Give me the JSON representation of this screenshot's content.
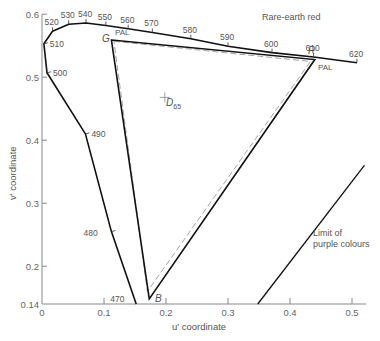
{
  "chart_data": {
    "type": "diagram",
    "xlabel": "u' coordinate",
    "ylabel": "v' coordinate",
    "xlim": [
      0,
      0.52
    ],
    "ylim": [
      0.14,
      0.6
    ],
    "x_ticks": [
      "0",
      "0.1",
      "0.2",
      "0.3",
      "0.4",
      "0.5"
    ],
    "x_tick_values": [
      0,
      0.1,
      0.2,
      0.3,
      0.4,
      0.5
    ],
    "y_ticks": [
      "0.14",
      "0.2",
      "0.3",
      "0.4",
      "0.5",
      "0.6"
    ],
    "y_tick_values": [
      0.14,
      0.2,
      0.3,
      0.4,
      0.5,
      0.6
    ],
    "spectrum_locus": [
      {
        "nm": 470,
        "u": 0.152,
        "v": 0.14
      },
      {
        "nm": 480,
        "u": 0.112,
        "v": 0.255
      },
      {
        "nm": 490,
        "u": 0.07,
        "v": 0.41
      },
      {
        "nm": 500,
        "u": 0.008,
        "v": 0.507
      },
      {
        "nm": 510,
        "u": 0.003,
        "v": 0.553
      },
      {
        "nm": 520,
        "u": 0.017,
        "v": 0.573
      },
      {
        "nm": 530,
        "u": 0.043,
        "v": 0.584
      },
      {
        "nm": 540,
        "u": 0.071,
        "v": 0.586
      },
      {
        "nm": 550,
        "u": 0.103,
        "v": 0.582
      },
      {
        "nm": 560,
        "u": 0.139,
        "v": 0.577
      },
      {
        "nm": 570,
        "u": 0.178,
        "v": 0.571
      },
      {
        "nm": 580,
        "u": 0.24,
        "v": 0.561
      },
      {
        "nm": 590,
        "u": 0.3,
        "v": 0.549
      },
      {
        "nm": 600,
        "u": 0.371,
        "v": 0.539
      },
      {
        "nm": 610,
        "u": 0.438,
        "v": 0.532
      },
      {
        "nm": 620,
        "u": 0.508,
        "v": 0.523
      }
    ],
    "rare_earth_gamut": {
      "G": [
        0.112,
        0.559
      ],
      "R": [
        0.44,
        0.528
      ],
      "B": [
        0.173,
        0.148
      ]
    },
    "pal_gamut": {
      "G": [
        0.116,
        0.557
      ],
      "R": [
        0.433,
        0.525
      ],
      "B": [
        0.17,
        0.16
      ]
    },
    "white_point": {
      "label": "D65",
      "u": 0.198,
      "v": 0.468
    },
    "purple_limit": {
      "from": [
        0.348,
        0.14
      ],
      "to": [
        0.52,
        0.36
      ]
    },
    "annotations": {
      "rare_earth_red": "Rare-earth red",
      "pal_g": "PAL",
      "pal_r": "PAL",
      "g": "G",
      "r": "R",
      "b": "B",
      "d": "D",
      "d_sub": "65",
      "purple_1": "Limit of",
      "purple_2": "purple colours"
    }
  }
}
